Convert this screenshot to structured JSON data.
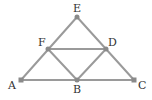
{
  "diagram": {
    "title": "",
    "points": {
      "A": {
        "label": "A",
        "x": 21,
        "y": 80
      },
      "B": {
        "label": "B",
        "x": 77,
        "y": 80
      },
      "C": {
        "label": "C",
        "x": 134,
        "y": 80
      },
      "D": {
        "label": "D",
        "x": 106,
        "y": 49
      },
      "E": {
        "label": "E",
        "x": 77,
        "y": 17
      },
      "F": {
        "label": "F",
        "x": 48,
        "y": 49
      }
    },
    "edges": [
      [
        "A",
        "C"
      ],
      [
        "A",
        "E"
      ],
      [
        "E",
        "C"
      ],
      [
        "F",
        "D"
      ],
      [
        "F",
        "B"
      ],
      [
        "B",
        "D"
      ]
    ],
    "colors": {
      "edge": "#9a9a9a",
      "point": "#8a8a8a",
      "label": "#333333"
    }
  }
}
